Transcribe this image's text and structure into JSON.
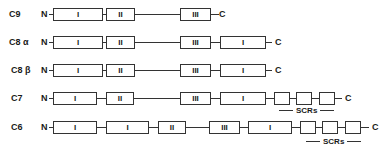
{
  "rows": [
    {
      "name": "C9",
      "label": "C9",
      "n": "N",
      "c": "C"
    },
    {
      "name": "C8a",
      "label": "C8 α",
      "n": "N",
      "c": "C"
    },
    {
      "name": "C8b",
      "label": "C8 β",
      "n": "N",
      "c": "C"
    },
    {
      "name": "C7",
      "label": "C7",
      "n": "N",
      "c": "C"
    },
    {
      "name": "C6",
      "label": "C6",
      "n": "N",
      "c": "C"
    }
  ],
  "domains": {
    "I": "I",
    "II": "II",
    "III": "III"
  },
  "scr_label": "SCRs"
}
